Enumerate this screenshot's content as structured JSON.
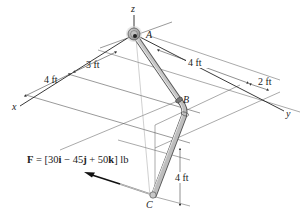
{
  "figure": {
    "type": "statics-3d-pipe-assembly",
    "axes": {
      "x_label": "x",
      "y_label": "y",
      "z_label": "z"
    },
    "points": {
      "A": "A",
      "B": "B",
      "C": "C"
    },
    "dimensions": {
      "x_near": "4 ft",
      "x_far": "3 ft",
      "y_main": "4 ft",
      "y_offset": "2 ft",
      "z_drop": "4 ft"
    },
    "force": {
      "symbol": "F",
      "equals": " = [30",
      "i": "i",
      "minus": " − 45",
      "j": "j",
      "plus": " + 50",
      "k": "k",
      "unit": "] lb"
    },
    "colors": {
      "line": "#333333",
      "pipe_fill": "#b8b8b8",
      "pipe_edge": "#555555",
      "arrow": "#111111",
      "support": "#9a9a9a"
    }
  }
}
